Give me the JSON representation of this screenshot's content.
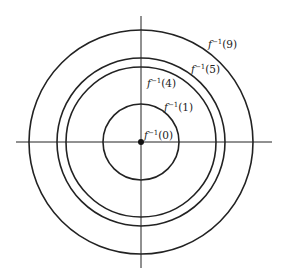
{
  "diagram": {
    "colors": {
      "stroke": "#222222",
      "background": "#ffffff"
    },
    "center": {
      "x": 141,
      "y": 142
    },
    "axes": {
      "horizontal": {
        "x1": 16,
        "x2": 272,
        "y": 142
      },
      "vertical": {
        "x": 141,
        "y1": 16,
        "y2": 268
      }
    },
    "origin_point": {
      "r": 3
    },
    "curves": [
      {
        "id": "f0",
        "value": 0,
        "radius": 0,
        "label_func": "f",
        "label_exp": "−1",
        "label_arg": "(0)",
        "label_x": 144,
        "label_y": 139
      },
      {
        "id": "f1",
        "value": 1,
        "radius": 38,
        "label_func": "f",
        "label_exp": "−1",
        "label_arg": "(1)",
        "label_x": 164,
        "label_y": 111
      },
      {
        "id": "f4",
        "value": 4,
        "radius": 75,
        "label_func": "f",
        "label_exp": "−1",
        "label_arg": "(4)",
        "label_x": 147,
        "label_y": 87
      },
      {
        "id": "f5",
        "value": 5,
        "radius": 84,
        "label_func": "f",
        "label_exp": "−1",
        "label_arg": "(5)",
        "label_x": 191,
        "label_y": 73
      },
      {
        "id": "f9",
        "value": 9,
        "radius": 112,
        "label_func": "f",
        "label_exp": "−1",
        "label_arg": "(9)",
        "label_x": 208,
        "label_y": 48
      }
    ]
  }
}
